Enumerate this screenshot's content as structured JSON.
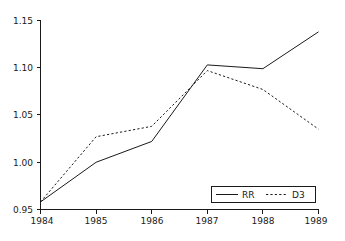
{
  "chart_data": {
    "type": "line",
    "title": "",
    "xlabel": "",
    "ylabel": "",
    "x": [
      1984,
      1985,
      1986,
      1987,
      1988,
      1989
    ],
    "categories": [
      "1984",
      "1985",
      "1986",
      "1987",
      "1988",
      "1989"
    ],
    "series": [
      {
        "name": "RR",
        "style": "solid",
        "color": "#1a1a1a",
        "values": [
          0.958,
          1.0,
          1.022,
          1.103,
          1.099,
          1.138
        ]
      },
      {
        "name": "D3",
        "style": "dashed",
        "color": "#1a1a1a",
        "values": [
          0.958,
          1.027,
          1.038,
          1.097,
          1.077,
          1.035
        ]
      }
    ],
    "xlim": [
      1984,
      1989
    ],
    "ylim": [
      0.95,
      1.15
    ],
    "ytick_labels": [
      "1.15",
      "1.10",
      "1.05",
      "1.00",
      "0.95"
    ],
    "ytick_values": [
      1.15,
      1.1,
      1.05,
      1.0,
      0.95
    ],
    "xtick_labels": [
      "1984",
      "1985",
      "1986",
      "1987",
      "1988",
      "1989"
    ],
    "grid": false,
    "legend_position": "bottom-right",
    "legend": [
      {
        "label": "RR",
        "style": "solid"
      },
      {
        "label": "D3",
        "style": "dashed"
      }
    ]
  },
  "axes": {
    "y_ticks": [
      {
        "label": "1.15"
      },
      {
        "label": "1.10"
      },
      {
        "label": "1.05"
      },
      {
        "label": "1.00"
      },
      {
        "label": "0.95"
      }
    ],
    "x_ticks": [
      {
        "label": "1984"
      },
      {
        "label": "1985"
      },
      {
        "label": "1986"
      },
      {
        "label": "1987"
      },
      {
        "label": "1988"
      },
      {
        "label": "1989"
      }
    ]
  },
  "legend": {
    "entry_rr": "RR",
    "entry_d3": "D3"
  },
  "colors": {
    "line": "#1a1a1a",
    "axis": "#1a1a1a",
    "background": "#ffffff"
  }
}
